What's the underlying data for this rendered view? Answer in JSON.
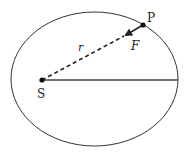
{
  "diagram": {
    "title": "",
    "type": "orbit-diagram",
    "colors": {
      "stroke": "#333333",
      "background": "#ffffff"
    },
    "ellipse": {
      "cx": 94.5,
      "cy": 79,
      "rx": 83.5,
      "ry": 67
    },
    "points": {
      "S": {
        "label": "S",
        "x": 42,
        "y": 80
      },
      "P": {
        "label": "P",
        "x": 143,
        "y": 25
      }
    },
    "labels": {
      "r": "r",
      "F": "F"
    },
    "segments": [
      {
        "name": "radius-vector",
        "from": "S",
        "to": "P",
        "style": "dashed",
        "label": "r"
      },
      {
        "name": "force-arrow",
        "from": "P",
        "toward": "S",
        "style": "solid-arrow",
        "label": "F"
      },
      {
        "name": "major-axis-half",
        "from": "S",
        "to": "right-vertex",
        "style": "solid"
      }
    ]
  }
}
